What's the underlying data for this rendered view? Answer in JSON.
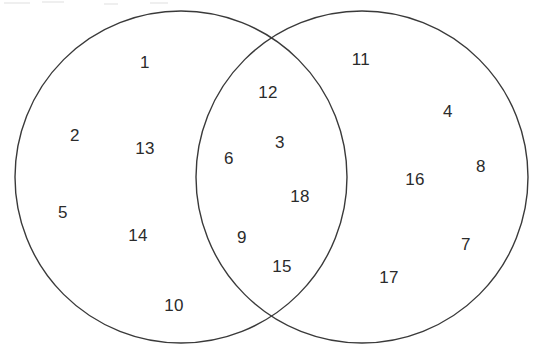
{
  "diagram": {
    "type": "venn-2-set",
    "stroke_color": "#3a3a3a",
    "text_color": "#2b2b2b",
    "background_color": "#ffffff",
    "left_circle": {
      "cx": 181,
      "cy": 177,
      "r": 166
    },
    "right_circle": {
      "cx": 362,
      "cy": 177,
      "r": 166
    }
  },
  "regions": {
    "left_only": {
      "name": "left-set-only",
      "items": [
        {
          "value": "1",
          "x": 145,
          "y": 62
        },
        {
          "value": "2",
          "x": 75,
          "y": 135
        },
        {
          "value": "13",
          "x": 145,
          "y": 148
        },
        {
          "value": "5",
          "x": 63,
          "y": 212
        },
        {
          "value": "14",
          "x": 138,
          "y": 235
        },
        {
          "value": "10",
          "x": 174,
          "y": 305
        }
      ]
    },
    "intersection": {
      "name": "intersection",
      "items": [
        {
          "value": "12",
          "x": 268,
          "y": 92
        },
        {
          "value": "3",
          "x": 280,
          "y": 142
        },
        {
          "value": "6",
          "x": 229,
          "y": 158
        },
        {
          "value": "18",
          "x": 300,
          "y": 196
        },
        {
          "value": "9",
          "x": 242,
          "y": 237
        },
        {
          "value": "15",
          "x": 282,
          "y": 266
        }
      ]
    },
    "right_only": {
      "name": "right-set-only",
      "items": [
        {
          "value": "11",
          "x": 361,
          "y": 59
        },
        {
          "value": "4",
          "x": 448,
          "y": 111
        },
        {
          "value": "8",
          "x": 481,
          "y": 166
        },
        {
          "value": "16",
          "x": 415,
          "y": 179
        },
        {
          "value": "7",
          "x": 466,
          "y": 244
        },
        {
          "value": "17",
          "x": 389,
          "y": 277
        }
      ]
    }
  },
  "all_values": [
    "1",
    "2",
    "3",
    "4",
    "5",
    "6",
    "7",
    "8",
    "9",
    "10",
    "11",
    "12",
    "13",
    "14",
    "15",
    "16",
    "17",
    "18"
  ]
}
